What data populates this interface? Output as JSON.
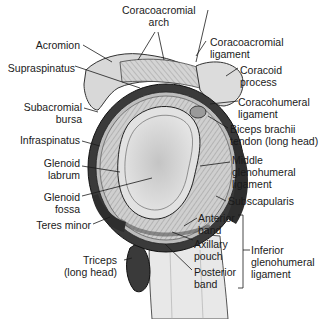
{
  "figure": {
    "labels_left": {
      "acromion": "Acromion",
      "supraspinatus": "Supraspinatus",
      "subacromial_bursa_1": "Subacromial",
      "subacromial_bursa_2": "bursa",
      "infraspinatus": "Infraspinatus",
      "glenoid_labrum_1": "Glenoid",
      "glenoid_labrum_2": "labrum",
      "glenoid_fossa_1": "Glenoid",
      "glenoid_fossa_2": "fossa",
      "teres_minor": "Teres minor",
      "triceps_1": "Triceps",
      "triceps_2": "(long head)"
    },
    "labels_top": {
      "coracoacromial_arch_1": "Coracoacromial",
      "coracoacromial_arch_2": "arch"
    },
    "labels_right": {
      "coracoacromial_ligament_1": "Coracoacromial",
      "coracoacromial_ligament_2": "ligament",
      "coracoid_process_1": "Coracoid",
      "coracoid_process_2": "process",
      "coracohumeral_ligament_1": "Coracohumeral",
      "coracohumeral_ligament_2": "ligament",
      "biceps_1": "Biceps brachii",
      "biceps_2": "tendon (long head)",
      "mghl_1": "Middle",
      "mghl_2": "glenohumeral",
      "mghl_3": "ligament",
      "subscapularis": "Subscapularis",
      "anterior_band_1": "Anterior",
      "anterior_band_2": "band",
      "axillary_pouch_1": "Axillary",
      "axillary_pouch_2": "pouch",
      "posterior_band_1": "Posterior",
      "posterior_band_2": "band",
      "ighl_1": "Inferior",
      "ighl_2": "glenohumeral",
      "ighl_3": "ligament"
    },
    "colors": {
      "ink": "#1a1a1a",
      "dark_muscle": "#3a3a3a",
      "mid_gray": "#9a9a9a",
      "light_gray": "#d6d6d6",
      "cartilage": "#e2e2e2",
      "background": "#ffffff"
    }
  }
}
